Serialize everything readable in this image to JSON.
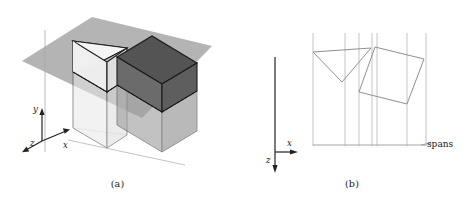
{
  "figure": {
    "type": "technical-diagram",
    "panels": [
      {
        "id": "a",
        "caption": "(a)",
        "view": "3d-isometric",
        "description": "Sweep plane intersecting two polyhedra",
        "axes": {
          "y_label": "y",
          "x_label": "x",
          "z_label": "z"
        },
        "objects": [
          {
            "name": "triangular-prism",
            "shade": "light"
          },
          {
            "name": "rectangular-box",
            "shade": "dark"
          }
        ],
        "plane": {
          "name": "sweep-plane",
          "shade": "gray"
        }
      },
      {
        "id": "b",
        "caption": "(b)",
        "view": "top-down-xz",
        "description": "Cross sections of the two objects with span boundaries",
        "axes": {
          "x_label": "x",
          "z_label": "z"
        },
        "spans_label": "spans",
        "cross_sections": [
          {
            "name": "triangle-cross-section"
          },
          {
            "name": "rectangle-cross-section"
          }
        ]
      }
    ]
  },
  "colors": {
    "plane_fill": "#b4b4b4",
    "prism_top_fill": "#f0f0f0",
    "prism_side_light": "#e2e2e2",
    "prism_side_shadow": "#d2d2d2",
    "prism_below_fill": "#dedede",
    "box_top_fill": "#5a5a5a",
    "box_front_fill": "#6e6e6e",
    "box_side_fill": "#636363",
    "box_below_fill": "#9a9a9a",
    "outline": "#1a1a1a",
    "span_line": "#b8b8b8",
    "axis": "#555555",
    "text": "#1a1a1a"
  }
}
